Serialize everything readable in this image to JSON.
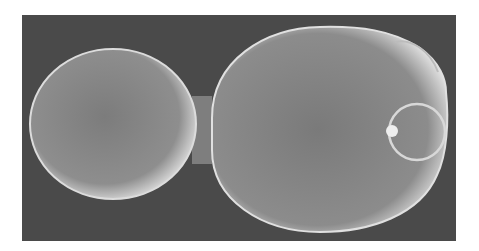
{
  "image": {
    "subject": "scanning electron micrograph of budding yeast cell",
    "background_color": "#4a4a4a",
    "page_color": "#ffffff",
    "cell_color": "#8a8a8a",
    "highlight_color": "#e6e6e6"
  }
}
